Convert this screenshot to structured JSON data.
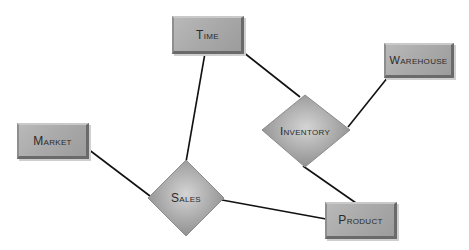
{
  "diagram": {
    "type": "entity-relationship",
    "entities": [
      {
        "id": "time",
        "label": "Time"
      },
      {
        "id": "warehouse",
        "label": "Warehouse"
      },
      {
        "id": "market",
        "label": "Market"
      },
      {
        "id": "product",
        "label": "Product"
      }
    ],
    "relationships": [
      {
        "id": "inventory",
        "label": "Inventory"
      },
      {
        "id": "sales",
        "label": "Sales"
      }
    ],
    "connections": [
      {
        "from": "Time",
        "to": "Sales"
      },
      {
        "from": "Time",
        "to": "Inventory"
      },
      {
        "from": "Warehouse",
        "to": "Inventory"
      },
      {
        "from": "Inventory",
        "to": "Product"
      },
      {
        "from": "Market",
        "to": "Sales"
      },
      {
        "from": "Sales",
        "to": "Product"
      }
    ]
  }
}
